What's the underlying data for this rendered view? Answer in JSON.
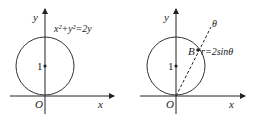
{
  "figures": [
    {
      "axis_x": "x",
      "axis_y": "y",
      "origin": "O",
      "center_tick": "1",
      "equation": "x²+y²=2y"
    },
    {
      "axis_x": "x",
      "axis_y": "y",
      "origin": "O",
      "center_tick": "1",
      "ray_label": "θ",
      "point_label": "B",
      "equation": "r=2sinθ"
    }
  ],
  "colors": {
    "stroke": "#222222"
  }
}
